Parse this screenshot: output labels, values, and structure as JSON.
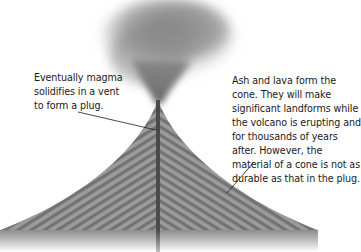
{
  "diagram": {
    "colors": {
      "background": "#ffffff",
      "cone_stripe_light": "#9a9a9a",
      "cone_stripe_dark": "#6e6e6e",
      "plug": "#4a4a4a",
      "ash_plume": "#7a7a7a",
      "text": "#1a1a1a",
      "leader_line": "#1a1a1a"
    },
    "labels": {
      "plug": {
        "lines": [
          "Eventually magma",
          "solidifies in a vent",
          "to form a plug."
        ]
      },
      "cone": {
        "lines": [
          "Ash and lava form the",
          "cone. They will make",
          "significant landforms while",
          "the volcano is erupting and",
          "for thousands of years",
          "after. However, the",
          "material of a cone is not as",
          "durable as that in the plug."
        ]
      }
    },
    "parts": [
      "ash-plume",
      "cone",
      "plug",
      "ground-base"
    ]
  }
}
